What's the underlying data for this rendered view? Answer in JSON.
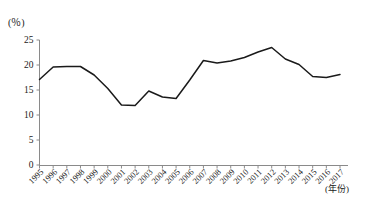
{
  "chart_data": {
    "type": "line",
    "title": "",
    "xlabel": "(年份)",
    "ylabel": "(％)",
    "unit_label": "(％)",
    "x_axis_title": "(年份)",
    "categories": [
      "1995",
      "1996",
      "1997",
      "1998",
      "1999",
      "2000",
      "2001",
      "2002",
      "2003",
      "2004",
      "2005",
      "2006",
      "2007",
      "2008",
      "2009",
      "2010",
      "2011",
      "2012",
      "2013",
      "2014",
      "2015",
      "2016",
      "2017"
    ],
    "values": [
      17.1,
      19.6,
      19.7,
      19.7,
      18.0,
      15.3,
      12.0,
      11.9,
      14.8,
      13.6,
      13.3,
      17.0,
      20.9,
      20.4,
      20.8,
      21.5,
      22.6,
      23.5,
      21.2,
      20.1,
      17.7,
      17.5,
      18.1
    ],
    "final_values_note": "",
    "ylim": [
      0,
      25
    ],
    "yticks": [
      0,
      5,
      10,
      15,
      20,
      25
    ],
    "ytick_labels": [
      "0",
      "5",
      "10",
      "15",
      "20",
      "25"
    ],
    "xlim": [
      "1995",
      "2017"
    ],
    "grid": false,
    "legend": false,
    "legend_position": "none",
    "series": [
      {
        "name": "",
        "color": "#1a1a1a",
        "values": [
          17.1,
          19.6,
          19.7,
          19.7,
          18.0,
          15.3,
          12.0,
          11.9,
          14.8,
          13.6,
          13.3,
          17.0,
          20.9,
          20.4,
          20.8,
          21.5,
          22.6,
          23.5,
          21.2,
          20.1,
          17.7,
          17.5,
          18.1
        ]
      }
    ]
  },
  "axes": {
    "y_unit": "(％)",
    "x_unit": "(年份)"
  }
}
